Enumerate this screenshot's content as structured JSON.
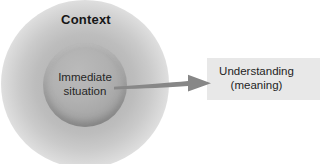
{
  "diagram": {
    "title_not_shown": null,
    "context": {
      "label": "Context"
    },
    "immediate_situation": {
      "line1": "Immediate",
      "line2": "situation"
    },
    "understanding_box": {
      "line1": "Understanding",
      "line2": "(meaning)"
    },
    "arrow": {
      "direction": "left-to-right",
      "from": "immediate-situation-circle",
      "to": "understanding-box"
    },
    "colors": {
      "glow_core": "#b3b3b3",
      "inner_circle": "#a7a7a7",
      "inner_circle_rim": "#8a8a8a",
      "arrow_fill": "#878787",
      "box_background": "#e8e8e8",
      "text": "#1f1f1f",
      "page_background": "#ffffff"
    }
  }
}
